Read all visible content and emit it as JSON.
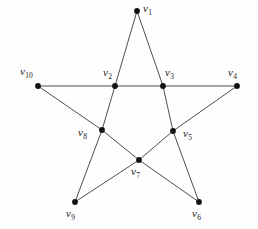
{
  "figure": {
    "width": 258,
    "height": 229,
    "background_color": "#fefefe",
    "edge_color": "#3a3a3a",
    "vertex_color": "#111111",
    "label_color": "#1a1a1a"
  },
  "chart_data": {
    "type": "diagram",
    "subtitle": "",
    "xlabel": "",
    "ylabel": "",
    "grid": false,
    "legend": "none",
    "vertices": [
      {
        "id": "v1",
        "label": "v",
        "subscript": "1",
        "x": 137,
        "y": 11,
        "label_x": 143,
        "label_y": 3,
        "role": "outer-point"
      },
      {
        "id": "v2",
        "label": "v",
        "subscript": "2",
        "x": 115,
        "y": 86,
        "label_x": 103,
        "label_y": 67,
        "role": "inner-pentagon"
      },
      {
        "id": "v3",
        "label": "v",
        "subscript": "3",
        "x": 163,
        "y": 86,
        "label_x": 165,
        "label_y": 67,
        "role": "inner-pentagon"
      },
      {
        "id": "v4",
        "label": "v",
        "subscript": "4",
        "x": 237,
        "y": 86,
        "label_x": 228,
        "label_y": 67,
        "role": "outer-point"
      },
      {
        "id": "v5",
        "label": "v",
        "subscript": "5",
        "x": 173,
        "y": 131,
        "label_x": 183,
        "label_y": 128,
        "role": "inner-pentagon"
      },
      {
        "id": "v6",
        "label": "v",
        "subscript": "6",
        "x": 199,
        "y": 202,
        "label_x": 192,
        "label_y": 208,
        "role": "outer-point"
      },
      {
        "id": "v7",
        "label": "v",
        "subscript": "7",
        "x": 139,
        "y": 160,
        "label_x": 131,
        "label_y": 166,
        "role": "inner-pentagon"
      },
      {
        "id": "v8",
        "label": "v",
        "subscript": "8",
        "x": 102,
        "y": 130,
        "label_x": 78,
        "label_y": 127,
        "role": "inner-pentagon"
      },
      {
        "id": "v9",
        "label": "v",
        "subscript": "9",
        "x": 75,
        "y": 202,
        "label_x": 66,
        "label_y": 208,
        "role": "outer-point"
      },
      {
        "id": "v10",
        "label": "v",
        "subscript": "10",
        "x": 38,
        "y": 86,
        "label_x": 20,
        "label_y": 66,
        "role": "outer-point"
      }
    ],
    "edges": [
      {
        "from": "v1",
        "to": "v2"
      },
      {
        "from": "v1",
        "to": "v3"
      },
      {
        "from": "v10",
        "to": "v2"
      },
      {
        "from": "v2",
        "to": "v3"
      },
      {
        "from": "v3",
        "to": "v4"
      },
      {
        "from": "v10",
        "to": "v8"
      },
      {
        "from": "v4",
        "to": "v5"
      },
      {
        "from": "v2",
        "to": "v8"
      },
      {
        "from": "v3",
        "to": "v5"
      },
      {
        "from": "v8",
        "to": "v7"
      },
      {
        "from": "v7",
        "to": "v5"
      },
      {
        "from": "v8",
        "to": "v9"
      },
      {
        "from": "v9",
        "to": "v7"
      },
      {
        "from": "v7",
        "to": "v6"
      },
      {
        "from": "v5",
        "to": "v6"
      }
    ],
    "vertex_count": 10,
    "edge_count": 15
  }
}
